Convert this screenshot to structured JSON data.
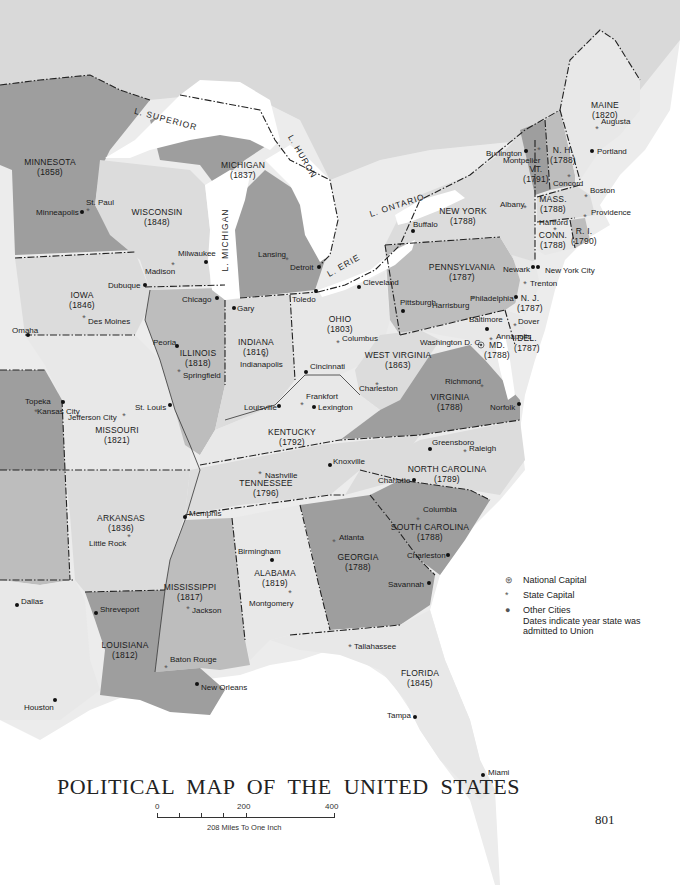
{
  "title": "POLITICAL MAP OF THE UNITED STATES",
  "page_number": "801",
  "scale": {
    "ticks": [
      "0",
      "200",
      "400"
    ],
    "caption": "208 Miles To One Inch"
  },
  "legend": {
    "items": [
      {
        "symbol": "national-capital",
        "glyph": "⊛",
        "label": "National Capital"
      },
      {
        "symbol": "state-capital",
        "glyph": "*",
        "label": "State Capital"
      },
      {
        "symbol": "other-city",
        "glyph": "●",
        "label": "Other Cities"
      }
    ],
    "note": "Dates indicate year state was admitted to Union"
  },
  "lakes": [
    {
      "name": "L. SUPERIOR",
      "x": 165,
      "y": 122,
      "rot": 15
    },
    {
      "name": "L. HURON",
      "x": 300,
      "y": 158,
      "rot": 60
    },
    {
      "name": "L. MICHIGAN",
      "x": 228,
      "y": 240,
      "rot": -90
    },
    {
      "name": "L. ERIE",
      "x": 345,
      "y": 268,
      "rot": -30
    },
    {
      "name": "L. ONTARIO",
      "x": 398,
      "y": 208,
      "rot": -18
    }
  ],
  "states": [
    {
      "name": "MINNESOTA",
      "year": "(1858)",
      "x": 50,
      "y": 165
    },
    {
      "name": "WISCONSIN",
      "year": "(1848)",
      "x": 157,
      "y": 215
    },
    {
      "name": "MICHIGAN",
      "year": "(1837)",
      "x": 243,
      "y": 168
    },
    {
      "name": "IOWA",
      "year": "(1846)",
      "x": 82,
      "y": 298
    },
    {
      "name": "ILLINOIS",
      "year": "(1818)",
      "x": 198,
      "y": 356
    },
    {
      "name": "INDIANA",
      "year": "(1816)",
      "x": 256,
      "y": 345
    },
    {
      "name": "OHIO",
      "year": "(1803)",
      "x": 340,
      "y": 322
    },
    {
      "name": "PENNSYLVANIA",
      "year": "(1787)",
      "x": 462,
      "y": 270
    },
    {
      "name": "NEW YORK",
      "year": "(1788)",
      "x": 463,
      "y": 214
    },
    {
      "name": "VT.",
      "year": "(1791)",
      "x": 536,
      "y": 172
    },
    {
      "name": "N. H.",
      "year": "(1788)",
      "x": 563,
      "y": 153
    },
    {
      "name": "MAINE",
      "year": "(1820)",
      "x": 605,
      "y": 108
    },
    {
      "name": "MASS.",
      "year": "(1788)",
      "x": 553,
      "y": 202
    },
    {
      "name": "CONN.",
      "year": "(1788)",
      "x": 553,
      "y": 238
    },
    {
      "name": "R. I.",
      "year": "(1790)",
      "x": 584,
      "y": 234
    },
    {
      "name": "N. J.",
      "year": "(1787)",
      "x": 530,
      "y": 301
    },
    {
      "name": "DEL.",
      "year": "(1787)",
      "x": 527,
      "y": 341
    },
    {
      "name": "MD.",
      "year": "(1788)",
      "x": 497,
      "y": 348
    },
    {
      "name": "WEST VIRGINIA",
      "year": "(1863)",
      "x": 398,
      "y": 358
    },
    {
      "name": "VIRGINIA",
      "year": "(1788)",
      "x": 450,
      "y": 400
    },
    {
      "name": "KENTUCKY",
      "year": "(1792)",
      "x": 292,
      "y": 435
    },
    {
      "name": "MISSOURI",
      "year": "(1821)",
      "x": 117,
      "y": 433
    },
    {
      "name": "TENNESSEE",
      "year": "(1796)",
      "x": 266,
      "y": 486
    },
    {
      "name": "NORTH CAROLINA",
      "year": "(1789)",
      "x": 447,
      "y": 472
    },
    {
      "name": "ARKANSAS",
      "year": "(1836)",
      "x": 121,
      "y": 521
    },
    {
      "name": "SOUTH CAROLINA",
      "year": "(1788)",
      "x": 430,
      "y": 530
    },
    {
      "name": "GEORGIA",
      "year": "(1788)",
      "x": 358,
      "y": 560
    },
    {
      "name": "ALABAMA",
      "year": "(1819)",
      "x": 275,
      "y": 576
    },
    {
      "name": "MISSISSIPPI",
      "year": "(1817)",
      "x": 190,
      "y": 590
    },
    {
      "name": "LOUISIANA",
      "year": "(1812)",
      "x": 125,
      "y": 648
    },
    {
      "name": "FLORIDA",
      "year": "(1845)",
      "x": 420,
      "y": 676
    }
  ],
  "cities": [
    {
      "name": "St. Paul",
      "type": "state-capital",
      "x": 88,
      "y": 211,
      "lx": 86,
      "ly": 205
    },
    {
      "name": "Minneapolis",
      "type": "other-city",
      "x": 82,
      "y": 212,
      "lx": 36,
      "ly": 215
    },
    {
      "name": "Milwaukee",
      "type": "other-city",
      "x": 206,
      "y": 262,
      "lx": 178,
      "ly": 256
    },
    {
      "name": "Madison",
      "type": "state-capital",
      "x": 173,
      "y": 265,
      "lx": 145,
      "ly": 274
    },
    {
      "name": "Lansing",
      "type": "state-capital",
      "x": 287,
      "y": 260,
      "lx": 258,
      "ly": 257
    },
    {
      "name": "Detroit",
      "type": "other-city",
      "x": 319,
      "y": 267,
      "lx": 290,
      "ly": 270
    },
    {
      "name": "Dubuque",
      "type": "other-city",
      "x": 145,
      "y": 285,
      "lx": 108,
      "ly": 288
    },
    {
      "name": "Chicago",
      "type": "other-city",
      "x": 217,
      "y": 298,
      "lx": 182,
      "ly": 302
    },
    {
      "name": "Gary",
      "type": "other-city",
      "x": 234,
      "y": 308,
      "lx": 237,
      "ly": 311
    },
    {
      "name": "Toledo",
      "type": "other-city",
      "x": 316,
      "y": 291,
      "lx": 292,
      "ly": 302
    },
    {
      "name": "Cleveland",
      "type": "other-city",
      "x": 359,
      "y": 287,
      "lx": 363,
      "ly": 285
    },
    {
      "name": "Buffalo",
      "type": "other-city",
      "x": 413,
      "y": 231,
      "lx": 413,
      "ly": 227
    },
    {
      "name": "Albany",
      "type": "state-capital",
      "x": 525,
      "y": 208,
      "lx": 500,
      "ly": 207
    },
    {
      "name": "Burlington",
      "type": "other-city",
      "x": 526,
      "y": 151,
      "lx": 486,
      "ly": 156
    },
    {
      "name": "Montpelier",
      "type": "state-capital",
      "x": 539,
      "y": 150,
      "lx": 503,
      "ly": 163
    },
    {
      "name": "Concord",
      "type": "state-capital",
      "x": 569,
      "y": 177,
      "lx": 553,
      "ly": 186
    },
    {
      "name": "Augusta",
      "type": "state-capital",
      "x": 597,
      "y": 129,
      "lx": 601,
      "ly": 124
    },
    {
      "name": "Portland",
      "type": "other-city",
      "x": 592,
      "y": 151,
      "lx": 597,
      "ly": 154
    },
    {
      "name": "Boston",
      "type": "state-capital",
      "x": 586,
      "y": 197,
      "lx": 590,
      "ly": 193
    },
    {
      "name": "Hartford",
      "type": "state-capital",
      "x": 555,
      "y": 230,
      "lx": 539,
      "ly": 225
    },
    {
      "name": "Providence",
      "type": "state-capital",
      "x": 585,
      "y": 217,
      "lx": 591,
      "ly": 215
    },
    {
      "name": "Newark",
      "type": "other-city",
      "x": 533,
      "y": 267,
      "lx": 503,
      "ly": 272
    },
    {
      "name": "New York City",
      "type": "other-city",
      "x": 538,
      "y": 267,
      "lx": 545,
      "ly": 273
    },
    {
      "name": "Trenton",
      "type": "state-capital",
      "x": 525,
      "y": 284,
      "lx": 530,
      "ly": 286
    },
    {
      "name": "Philadelphia",
      "type": "other-city",
      "x": 516,
      "y": 297,
      "lx": 470,
      "ly": 301
    },
    {
      "name": "Harrisburg",
      "type": "state-capital",
      "x": 473,
      "y": 299,
      "lx": 432,
      "ly": 308
    },
    {
      "name": "Pittsburgh",
      "type": "other-city",
      "x": 403,
      "y": 311,
      "lx": 400,
      "ly": 305
    },
    {
      "name": "Baltimore",
      "type": "other-city",
      "x": 487,
      "y": 329,
      "lx": 469,
      "ly": 322
    },
    {
      "name": "Dover",
      "type": "state-capital",
      "x": 515,
      "y": 326,
      "lx": 518,
      "ly": 324
    },
    {
      "name": "Annapolis",
      "type": "state-capital",
      "x": 491,
      "y": 340,
      "lx": 496,
      "ly": 339
    },
    {
      "name": "Washington D. C.",
      "type": "national-capital",
      "x": 481,
      "y": 345,
      "lx": 420,
      "ly": 345
    },
    {
      "name": "Columbus",
      "type": "state-capital",
      "x": 338,
      "y": 343,
      "lx": 342,
      "ly": 341
    },
    {
      "name": "Cincinnati",
      "type": "other-city",
      "x": 306,
      "y": 372,
      "lx": 310,
      "ly": 369
    },
    {
      "name": "Richmond",
      "type": "state-capital",
      "x": 482,
      "y": 387,
      "lx": 445,
      "ly": 384
    },
    {
      "name": "Norfolk",
      "type": "other-city",
      "x": 519,
      "y": 404,
      "lx": 490,
      "ly": 410
    },
    {
      "name": "Charleston",
      "type": "state-capital",
      "x": 377,
      "y": 385,
      "lx": 359,
      "ly": 391
    },
    {
      "name": "Frankfort",
      "type": "state-capital",
      "x": 302,
      "y": 405,
      "lx": 306,
      "ly": 399
    },
    {
      "name": "Lexington",
      "type": "other-city",
      "x": 314,
      "y": 407,
      "lx": 318,
      "ly": 410
    },
    {
      "name": "Louisville",
      "type": "other-city",
      "x": 279,
      "y": 406,
      "lx": 244,
      "ly": 410
    },
    {
      "name": "Omaha",
      "type": "other-city",
      "x": 28,
      "y": 335,
      "lx": 12,
      "ly": 333
    },
    {
      "name": "Des Moines",
      "type": "state-capital",
      "x": 84,
      "y": 318,
      "lx": 88,
      "ly": 324
    },
    {
      "name": "Peoria",
      "type": "other-city",
      "x": 177,
      "y": 346,
      "lx": 153,
      "ly": 345
    },
    {
      "name": "Springfield",
      "type": "state-capital",
      "x": 179,
      "y": 372,
      "lx": 183,
      "ly": 378
    },
    {
      "name": "Indianapolis",
      "type": "state-capital",
      "x": 264,
      "y": 357,
      "lx": 240,
      "ly": 367
    },
    {
      "name": "Topeka",
      "type": "state-capital",
      "x": 36,
      "y": 412,
      "lx": 25,
      "ly": 404
    },
    {
      "name": "Kansas City",
      "type": "other-city",
      "x": 63,
      "y": 402,
      "lx": 37,
      "ly": 414
    },
    {
      "name": "Jefferson City",
      "type": "state-capital",
      "x": 124,
      "y": 416,
      "lx": 68,
      "ly": 420
    },
    {
      "name": "St. Louis",
      "type": "other-city",
      "x": 170,
      "y": 405,
      "lx": 135,
      "ly": 410
    },
    {
      "name": "Nashville",
      "type": "state-capital",
      "x": 260,
      "y": 474,
      "lx": 265,
      "ly": 478
    },
    {
      "name": "Knoxville",
      "type": "other-city",
      "x": 330,
      "y": 465,
      "lx": 333,
      "ly": 464
    },
    {
      "name": "Greensboro",
      "type": "other-city",
      "x": 430,
      "y": 449,
      "lx": 432,
      "ly": 445
    },
    {
      "name": "Raleigh",
      "type": "state-capital",
      "x": 465,
      "y": 452,
      "lx": 469,
      "ly": 451
    },
    {
      "name": "Charlotte",
      "type": "other-city",
      "x": 414,
      "y": 480,
      "lx": 378,
      "ly": 483
    },
    {
      "name": "Columbia",
      "type": "state-capital",
      "x": 418,
      "y": 520,
      "lx": 423,
      "ly": 512
    },
    {
      "name": "Charleston",
      "type": "other-city",
      "x": 448,
      "y": 555,
      "lx": 407,
      "ly": 558
    },
    {
      "name": "Savannah",
      "type": "other-city",
      "x": 429,
      "y": 583,
      "lx": 388,
      "ly": 587
    },
    {
      "name": "Atlanta",
      "type": "state-capital",
      "x": 334,
      "y": 542,
      "lx": 339,
      "ly": 540
    },
    {
      "name": "Memphis",
      "type": "other-city",
      "x": 185,
      "y": 517,
      "lx": 189,
      "ly": 516
    },
    {
      "name": "Little Rock",
      "type": "state-capital",
      "x": 129,
      "y": 537,
      "lx": 89,
      "ly": 546
    },
    {
      "name": "Birmingham",
      "type": "other-city",
      "x": 272,
      "y": 560,
      "lx": 238,
      "ly": 554
    },
    {
      "name": "Montgomery",
      "type": "state-capital",
      "x": 290,
      "y": 593,
      "lx": 249,
      "ly": 606
    },
    {
      "name": "Jackson",
      "type": "state-capital",
      "x": 188,
      "y": 609,
      "lx": 192,
      "ly": 613
    },
    {
      "name": "Dallas",
      "type": "other-city",
      "x": 17,
      "y": 605,
      "lx": 21,
      "ly": 604
    },
    {
      "name": "Shreveport",
      "type": "other-city",
      "x": 96,
      "y": 613,
      "lx": 100,
      "ly": 612
    },
    {
      "name": "Baton Rouge",
      "type": "state-capital",
      "x": 166,
      "y": 668,
      "lx": 170,
      "ly": 662
    },
    {
      "name": "New Orleans",
      "type": "other-city",
      "x": 197,
      "y": 684,
      "lx": 201,
      "ly": 690
    },
    {
      "name": "Houston",
      "type": "other-city",
      "x": 55,
      "y": 700,
      "lx": 24,
      "ly": 710
    },
    {
      "name": "Tallahassee",
      "type": "state-capital",
      "x": 350,
      "y": 647,
      "lx": 354,
      "ly": 649
    },
    {
      "name": "Tampa",
      "type": "other-city",
      "x": 415,
      "y": 717,
      "lx": 387,
      "ly": 718
    },
    {
      "name": "Miami",
      "type": "other-city",
      "x": 483,
      "y": 775,
      "lx": 488,
      "ly": 775
    }
  ]
}
